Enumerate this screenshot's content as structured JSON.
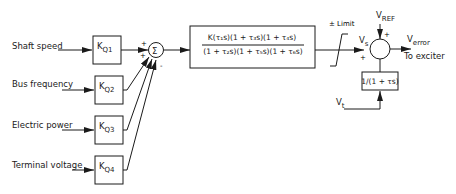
{
  "diagram": {
    "type": "block-diagram",
    "inputs": [
      {
        "label": "Shaft speed",
        "gain": "K",
        "gain_sub": "Q1",
        "sign": "+"
      },
      {
        "label": "Bus frequency",
        "gain": "K",
        "gain_sub": "Q2",
        "sign": "+"
      },
      {
        "label": "Electric power",
        "gain": "K",
        "gain_sub": "Q3",
        "sign": "+"
      },
      {
        "label": "Terminal voltage",
        "gain": "K",
        "gain_sub": "Q4",
        "sign": "-"
      }
    ],
    "summer1": {
      "symbol": "Σ"
    },
    "transfer_function": {
      "numerator": "K(τ₁s)(1 + τ₃s)(1 + τ₄s)",
      "denominator": "(1 + τ₂s)(1 + τ₅s)(1 + τ₆s)"
    },
    "limiter": {
      "label": "± Limit"
    },
    "summer2": {
      "input_vs": "V",
      "input_vs_sub": "s",
      "input_vs_sign": "+",
      "ref": "V",
      "ref_sub": "REF",
      "ref_sign": "+",
      "feedback_sign": "-"
    },
    "feedback_block": {
      "label": "1/(1 + τs)"
    },
    "vt": {
      "label": "V",
      "sub": "t"
    },
    "output": {
      "label": "V",
      "sub": "error",
      "destination": "To exciter"
    }
  }
}
